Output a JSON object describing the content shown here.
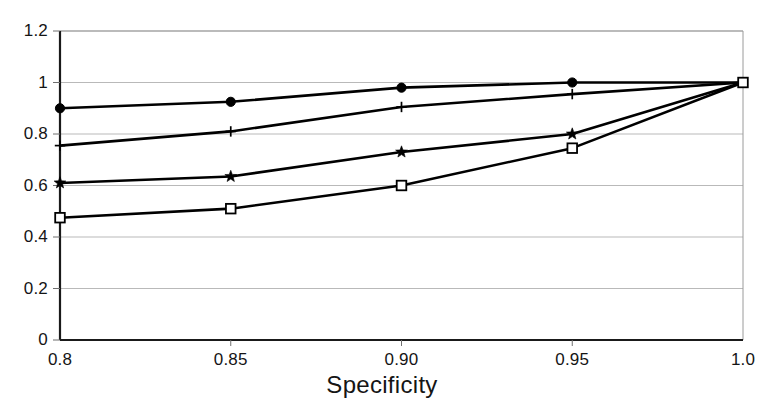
{
  "chart_data": {
    "type": "line",
    "title": "",
    "xlabel": "Specificity",
    "ylabel": "",
    "x": [
      0.8,
      0.85,
      0.9,
      0.95,
      1.0
    ],
    "xtick_labels": [
      "0.8",
      "0.85",
      "0.90",
      "0.95",
      "1.0"
    ],
    "ytick_labels": [
      "0",
      "0.2",
      "0.4",
      "0.6",
      "0.8",
      "1",
      "1.2"
    ],
    "ytick_values": [
      0,
      0.2,
      0.4,
      0.6,
      0.8,
      1.0,
      1.2
    ],
    "xlim": [
      0.8,
      1.0
    ],
    "ylim": [
      0,
      1.2
    ],
    "grid": "horizontal",
    "legend": "none",
    "series": [
      {
        "name": "series-1",
        "marker": "filled-circle",
        "color": "#000000",
        "values": [
          0.9,
          0.925,
          0.98,
          1.0,
          1.0
        ]
      },
      {
        "name": "series-2",
        "marker": "plus",
        "color": "#000000",
        "values": [
          0.755,
          0.81,
          0.905,
          0.955,
          1.0
        ]
      },
      {
        "name": "series-3",
        "marker": "star",
        "color": "#000000",
        "values": [
          0.61,
          0.635,
          0.73,
          0.8,
          1.0
        ]
      },
      {
        "name": "series-4",
        "marker": "open-square",
        "color": "#000000",
        "values": [
          0.475,
          0.51,
          0.6,
          0.745,
          1.0
        ]
      }
    ]
  }
}
